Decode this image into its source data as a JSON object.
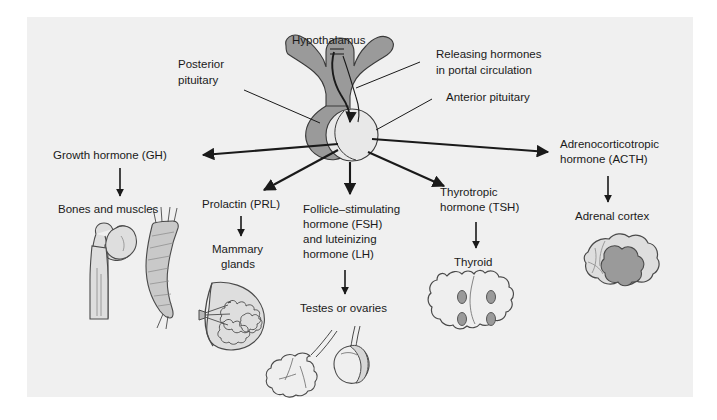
{
  "figure": {
    "background_color": "#ffffff",
    "panel_color": "#f0f0f0",
    "ink_color": "#1a1a1a",
    "tissue_dark_gray": "#9a9a9a",
    "tissue_mid_gray": "#b5b5b5",
    "tissue_light_gray": "#dedede",
    "tissue_pale": "#e8e8e8"
  },
  "anatomy_labels": {
    "hypothalamus": "Hypothalamus",
    "posterior_pituitary_line1": "Posterior",
    "posterior_pituitary_line2": "pituitary",
    "releasing_hormones_line1": "Releasing hormones",
    "releasing_hormones_line2": "in portal circulation",
    "anterior_pituitary": "Anterior pituitary"
  },
  "pathways": [
    {
      "id": "gh",
      "hormone_lines": [
        "Growth hormone (GH)"
      ],
      "target_lines": [
        "Bones and muscles"
      ],
      "organ": "bone-and-muscle-illustration"
    },
    {
      "id": "prl",
      "hormone_lines": [
        "Prolactin (PRL)"
      ],
      "target_lines": [
        "Mammary",
        "glands"
      ],
      "organ": "mammary-gland-illustration"
    },
    {
      "id": "fsh-lh",
      "hormone_lines": [
        "Follicle–stimulating",
        "hormone (FSH)",
        "and luteinizing",
        "hormone (LH)"
      ],
      "target_lines": [
        "Testes or ovaries"
      ],
      "organ": "gonad-illustration"
    },
    {
      "id": "tsh",
      "hormone_lines": [
        "Thyrotropic",
        "hormone (TSH)"
      ],
      "target_lines": [
        "Thyroid"
      ],
      "organ": "thyroid-illustration"
    },
    {
      "id": "acth",
      "hormone_lines": [
        "Adrenocorticotropic",
        "hormone (ACTH)"
      ],
      "target_lines": [
        "Adrenal cortex"
      ],
      "organ": "adrenal-gland-illustration"
    }
  ]
}
